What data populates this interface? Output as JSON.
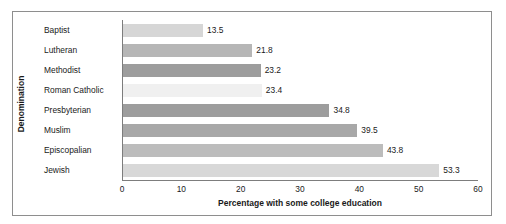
{
  "chart_data": {
    "type": "bar",
    "orientation": "horizontal",
    "title": "",
    "xlabel": "Percentage with some college education",
    "ylabel": "Denomination",
    "categories": [
      "Baptist",
      "Lutheran",
      "Methodist",
      "Roman Catholic",
      "Presbyterian",
      "Muslim",
      "Episcopalian",
      "Jewish"
    ],
    "values": [
      13.5,
      21.8,
      23.2,
      23.4,
      34.8,
      39.5,
      43.8,
      53.3
    ],
    "value_labels": [
      "13.5",
      "21.8",
      "23.2",
      "23.4",
      "34.8",
      "39.5",
      "43.8",
      "53.3"
    ],
    "bar_colors": [
      "#d6d6d6",
      "#b6b6b6",
      "#9d9d9d",
      "#f0f0f0",
      "#9d9d9d",
      "#a8a8a8",
      "#bcbcbc",
      "#d8d8d8"
    ],
    "xlim": [
      0,
      60
    ],
    "xticks": [
      0,
      10,
      20,
      30,
      40,
      50,
      60
    ],
    "xtick_labels": [
      "0",
      "10",
      "20",
      "30",
      "40",
      "50",
      "60"
    ],
    "grid": false,
    "legend": false,
    "frame_color": "#8e8e8e",
    "axis_color": "#7d7d7d",
    "text_color": "#1a1a1a"
  }
}
